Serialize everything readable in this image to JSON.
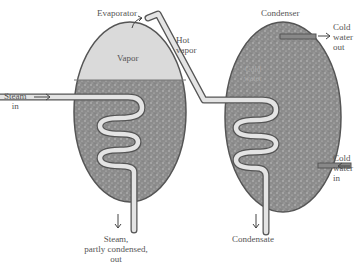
{
  "diagram": {
    "evaporator": {
      "title": "Evaporator",
      "vapor_label": "Vapor"
    },
    "condenser": {
      "title": "Condenser",
      "water_label_1": "Cold",
      "water_label_2": "water"
    },
    "hot_vapor": {
      "line1": "Hot",
      "line2": "vapor"
    },
    "steam_in": {
      "line1": "Steam",
      "line2": "in"
    },
    "steam_out": {
      "line1": "Steam,",
      "line2": "partly condensed,",
      "line3": "out"
    },
    "cold_water_out": {
      "line1": "Cold",
      "line2": "water",
      "line3": "out"
    },
    "cold_water_in": {
      "line1": "Cold",
      "line2": "water",
      "line3": "in"
    },
    "condensate": {
      "label": "Condensate"
    },
    "colors": {
      "liquid": "#8a8a8a",
      "vapor": "#dcdcdc",
      "outline": "#555555",
      "pipe": "#e4e4e4"
    }
  }
}
